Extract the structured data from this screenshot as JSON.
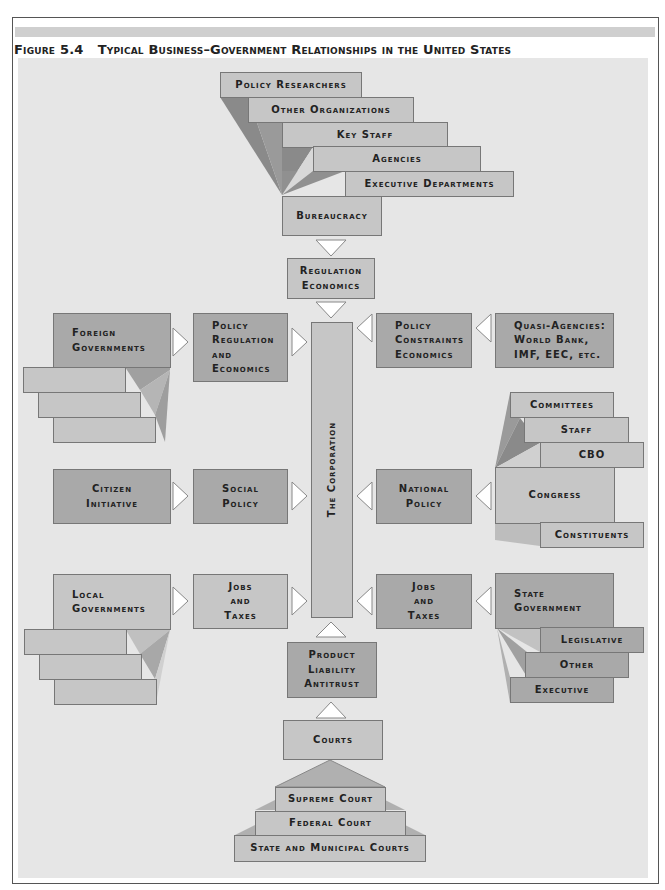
{
  "figure": {
    "label": "Figure 5.4",
    "title": "Typical Business–Government Relationships in the United States"
  },
  "center": {
    "corporation": "The Corporation",
    "top_link": "Regulation\nEconomics",
    "bottom_link": "Product\nLiability\nAntitrust"
  },
  "bureaucracy": {
    "items": [
      "Policy Researchers",
      "Other Organizations",
      "Key Staff",
      "Agencies",
      "Executive Departments"
    ],
    "base": "Bureaucracy"
  },
  "left": {
    "foreign": {
      "source": "Foreign\nGovernments",
      "link": "Policy\nRegulation\nand\nEconomics"
    },
    "citizen": {
      "source": "Citizen\nInitiative",
      "link": "Social\nPolicy"
    },
    "local": {
      "source": "Local\nGovernments",
      "link": "Jobs\nand\nTaxes"
    }
  },
  "right": {
    "quasi": {
      "source": "Quasi-Agencies:\nWorld Bank,\nIMF, EEC, etc.",
      "link": "Policy\nConstraints\nEconomics"
    },
    "congress": {
      "source": "Congress",
      "link": "National\nPolicy",
      "items": [
        "Committees",
        "Staff",
        "CBO"
      ],
      "below": "Constituents"
    },
    "state": {
      "source": "State\nGovernment",
      "link": "Jobs\nand\nTaxes",
      "items": [
        "Legislative",
        "Other",
        "Executive"
      ]
    }
  },
  "courts": {
    "head": "Courts",
    "levels": [
      "Supreme Court",
      "Federal Court",
      "State and Municipal Courts"
    ]
  },
  "colors": {
    "panel": "#e6e6e6",
    "box": "#b9b9b9",
    "box_dark": "#a9a9a9",
    "shade_dark": "#8a8a8a",
    "arrow": "#ffffff"
  }
}
